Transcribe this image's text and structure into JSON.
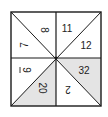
{
  "diagram": {
    "type": "number-square-puzzle",
    "colors": {
      "stroke": "#1a1a1a",
      "background": "#ffffff",
      "shade": "#e4e4e4",
      "text": "#222222"
    },
    "cells": [
      {
        "id": "tl-upper",
        "quadrant": "top-left",
        "value": "8",
        "rotation": 90,
        "shaded": false
      },
      {
        "id": "tl-lower",
        "quadrant": "top-left",
        "value": "7",
        "rotation": -90,
        "shaded": false
      },
      {
        "id": "tr-upper",
        "quadrant": "top-right",
        "value": "11",
        "rotation": 0,
        "shaded": false
      },
      {
        "id": "tr-lower",
        "quadrant": "top-right",
        "value": "12",
        "rotation": 0,
        "shaded": false
      },
      {
        "id": "bl-upper",
        "quadrant": "bottom-left",
        "value": "9",
        "underlined": true,
        "rotation": 90,
        "shaded": false
      },
      {
        "id": "bl-lower",
        "quadrant": "bottom-left",
        "value": "20",
        "rotation": 90,
        "shaded": true
      },
      {
        "id": "br-upper",
        "quadrant": "bottom-right",
        "value": "32",
        "rotation": 0,
        "shaded": true
      },
      {
        "id": "br-lower",
        "quadrant": "bottom-right",
        "value": "2",
        "rotation": 180,
        "shaded": false
      }
    ]
  }
}
